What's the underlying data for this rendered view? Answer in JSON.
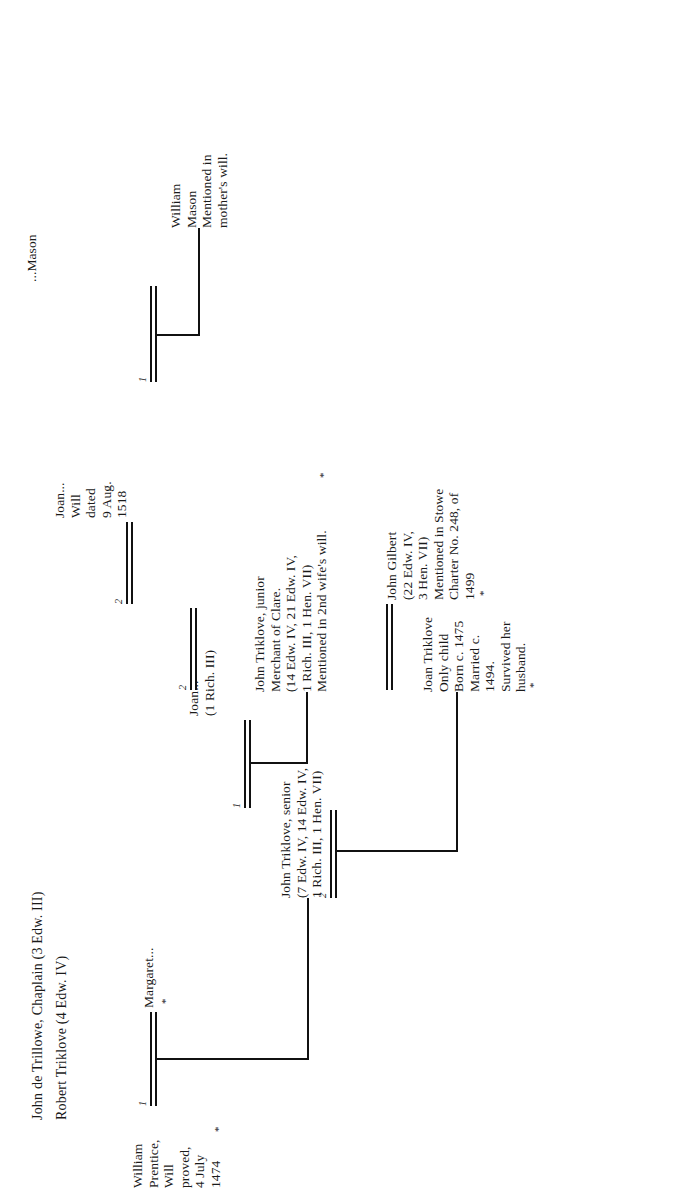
{
  "document": {
    "type": "pedigree-chart",
    "orientation": "rotated-90-ccw",
    "title_lines": [
      "John de Trillowe, Chaplain (3 Edw. III)",
      "Robert Triklove (4 Edw. IV)"
    ]
  },
  "nodes": {
    "william_prentice": {
      "name": "william-prentice",
      "text": "William\nPrentice,\nWill\nproved,\n4 July\n1474"
    },
    "margaret": {
      "name": "margaret",
      "text": "Margaret..."
    },
    "john_triklove_senior": {
      "name": "john-triklove-senior",
      "text": "John Triklove, senior\n(7 Edw. IV, 14 Edw. IV,\n1 Rich. III, 1 Hen. VII)"
    },
    "joan_first_wife": {
      "name": "joan-first-wife",
      "text": "Joan...\n(1 Rich. III)"
    },
    "john_triklove_junior": {
      "name": "john-triklove-junior",
      "text": "John Triklove, junior\nMerchant of Clare.\n(14 Edw. IV, 21 Edw. IV,\n1 Rich. III, 1 Hen. VII)\nMentioned in 2nd wife's will."
    },
    "joan_second_wife": {
      "name": "joan-second-wife",
      "text": "Joan...\nWill\ndated\n9 Aug.\n1518"
    },
    "mason": {
      "name": "mason-spouse",
      "text": "...Mason"
    },
    "william_mason": {
      "name": "william-mason",
      "text": "William\nMason\nMentioned in\nmother's will."
    },
    "joan_triklove": {
      "name": "joan-triklove",
      "text": "Joan Triklove\nOnly child\nBorn c. 1475\nMarried c.\n1494.\nSurvived her\nhusband."
    },
    "john_gilbert": {
      "name": "john-gilbert",
      "text": "John Gilbert\n(22 Edw. IV,\n3 Hen. VII)\nMentioned in Stowe\nCharter No. 248, of\n1499"
    }
  },
  "marriage_numbers": {
    "prentice_margaret": "1",
    "senior_first_marriage": "2",
    "senior_second_marriage": "1",
    "junior_first_marriage": "2",
    "junior_second_marriage": "2",
    "mason_marriage": "1",
    "gilbert_marriage": ""
  },
  "asterisks": {
    "prentice": "*",
    "margaret": "*",
    "junior_note": "*",
    "joan_triklove": "*",
    "john_gilbert": "*"
  },
  "colors": {
    "ink": "#111111",
    "paper": "#ffffff"
  }
}
